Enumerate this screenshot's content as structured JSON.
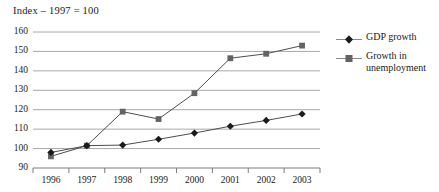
{
  "chart": {
    "title": "Index – 1997 = 100"
  },
  "chart_data": {
    "type": "line",
    "title": "Index – 1997 = 100",
    "xlabel": "",
    "ylabel": "",
    "categories": [
      "1996",
      "1997",
      "1998",
      "1999",
      "2000",
      "2001",
      "2002",
      "2003"
    ],
    "ylim": [
      90,
      160
    ],
    "yticks": [
      90,
      100,
      110,
      120,
      130,
      140,
      150,
      160
    ],
    "grid": true,
    "legend_position": "right",
    "series": [
      {
        "name": "GDP growth",
        "marker": "diamond",
        "color": "#1a1a1a",
        "values": [
          98.0,
          101.5,
          101.8,
          104.8,
          108.0,
          111.5,
          114.5,
          117.8
        ]
      },
      {
        "name": "Growth in unemployment",
        "marker": "square",
        "color": "#636363",
        "values": [
          96.0,
          101.5,
          119.0,
          115.2,
          128.5,
          146.5,
          148.8,
          153.0
        ]
      }
    ]
  },
  "axes": {
    "ytick_labels": [
      "160",
      "150",
      "140",
      "130",
      "120",
      "110",
      "100",
      "90"
    ],
    "xtick_labels": [
      "1996",
      "1997",
      "1998",
      "1999",
      "2000",
      "2001",
      "2002",
      "2003"
    ]
  },
  "legend": {
    "items": [
      {
        "label": "GDP growth"
      },
      {
        "label": "Growth in unemployment"
      }
    ]
  },
  "colors": {
    "gdp": "#1a1a1a",
    "unemployment": "#636363",
    "grid": "#a8a8a8",
    "axis": "#7d7d7d",
    "text": "#1a1a1a",
    "background": "#ffffff"
  }
}
